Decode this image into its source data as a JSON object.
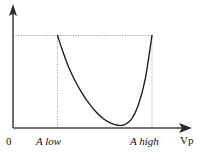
{
  "chart_data": {
    "type": "line",
    "title": "",
    "xlabel": "Vp",
    "ylabel": "",
    "grid": false,
    "legend": null,
    "xlim": [
      0,
      1
    ],
    "ylim": [
      0,
      1
    ],
    "axis_origin_label": "0",
    "x_tick_labels": [
      "0",
      "A low",
      "A high"
    ],
    "annotations": [
      "dashed horizontal line at curve endpoint level",
      "dashed vertical line at A low",
      "dashed vertical line at A high"
    ],
    "series": [
      {
        "name": "cost curve",
        "x": [
          0.32,
          0.36,
          0.4,
          0.45,
          0.5,
          0.55,
          0.6,
          0.65,
          0.7,
          0.75,
          0.8,
          0.85,
          0.9,
          0.95,
          1.0
        ],
        "y": [
          1.0,
          0.82,
          0.66,
          0.5,
          0.37,
          0.26,
          0.17,
          0.1,
          0.055,
          0.03,
          0.035,
          0.09,
          0.24,
          0.52,
          1.0
        ]
      }
    ],
    "markers": {
      "a_low_x": 0.32,
      "a_high_x": 1.0,
      "top_level_y": 1.0,
      "minimum_x": 0.755,
      "minimum_y": 0.03
    }
  },
  "axes": {
    "x_axis_name": "horizontal-axis",
    "y_axis_name": "vertical-axis",
    "x_arrow": "arrow-right",
    "y_arrow": "arrow-up"
  },
  "labels": {
    "zero": "0",
    "a_low": "A low",
    "a_high": "A high",
    "vp": "Vp"
  },
  "colors": {
    "curve": "#1a1a1a",
    "axis": "#4a4a4a",
    "dashed": "#9a9a9a",
    "background": "#ffffff",
    "text": "#111111"
  }
}
